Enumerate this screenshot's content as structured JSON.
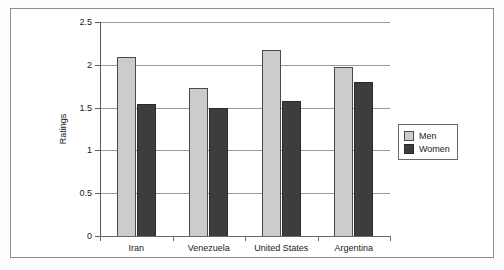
{
  "chart_data": {
    "type": "bar",
    "title": "",
    "subtitle": "",
    "xlabel": "",
    "ylabel": "Ratings",
    "categories": [
      "Iran",
      "Venezuela",
      "United States",
      "Argentina"
    ],
    "series": [
      {
        "name": "Men",
        "color": "#cccccc",
        "values": [
          2.09,
          1.73,
          2.17,
          1.98
        ]
      },
      {
        "name": "Women",
        "color": "#3d3d3d",
        "values": [
          1.54,
          1.49,
          1.58,
          1.8
        ]
      }
    ],
    "ylim": [
      0,
      2.5
    ],
    "yticks": [
      0,
      0.5,
      1,
      1.5,
      2,
      2.5
    ],
    "ytick_labels": [
      "0",
      "0.5",
      "1",
      "1.5",
      "2",
      "2.5"
    ],
    "grid": true,
    "grid_axis": "y",
    "legend_position": "right",
    "orientation": "vertical",
    "grouping": "grouped"
  },
  "legend": {
    "entries": [
      {
        "label": "Men"
      },
      {
        "label": "Women"
      }
    ]
  },
  "axes": {
    "y_title": "Ratings"
  }
}
